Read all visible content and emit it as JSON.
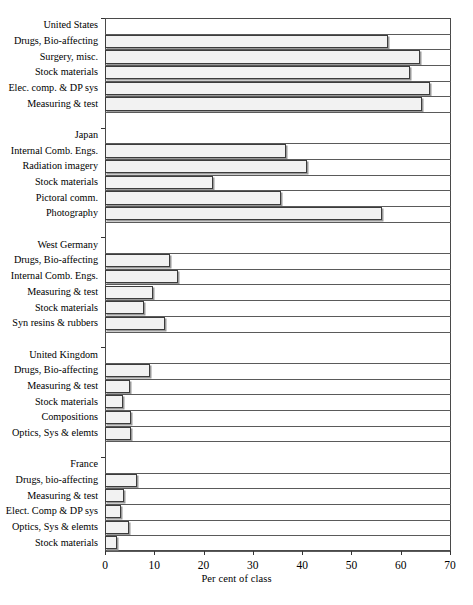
{
  "chart_data": {
    "type": "bar",
    "orientation": "horizontal",
    "title": "",
    "xlabel": "Per cent of class",
    "ylabel": "",
    "xlim": [
      0,
      70
    ],
    "xticks": [
      0,
      10,
      20,
      30,
      40,
      50,
      60,
      70
    ],
    "xticklabels": [
      "0",
      "10",
      "20",
      "30",
      "40",
      "50",
      "60",
      "70"
    ],
    "grid": false,
    "legend": null,
    "groups": [
      {
        "name": "United States",
        "categories": [
          "Drugs, Bio-affecting",
          "Surgery, misc.",
          "Stock materials",
          "Elec. comp. & DP sys",
          "Measuring & test"
        ],
        "values": [
          57.5,
          63.9,
          61.8,
          65.9,
          64.4
        ]
      },
      {
        "name": "Japan",
        "categories": [
          "Internal Comb. Engs.",
          "Radiation imagery",
          "Stock materials",
          "Pictoral comm.",
          "Photography"
        ],
        "values": [
          36.8,
          41.0,
          21.9,
          35.8,
          56.3
        ]
      },
      {
        "name": "West Germany",
        "categories": [
          "Drugs, Bio-affecting",
          "Internal Comb. Engs.",
          "Measuring & test",
          "Stock materials",
          "Syn resins & rubbers"
        ],
        "values": [
          13.2,
          14.9,
          9.8,
          8.0,
          12.2
        ]
      },
      {
        "name": "United Kingdom",
        "categories": [
          "Drugs, Bio-affecting",
          "Measuring & test",
          "Stock materials",
          "Compositions",
          "Optics, Sys & elemts"
        ],
        "values": [
          9.1,
          5.1,
          3.6,
          5.2,
          5.3
        ]
      },
      {
        "name": "France",
        "categories": [
          "Drugs, bio-affecting",
          "Measuring & test",
          "Elect. Comp & DP sys",
          "Optics, Sys & elemts",
          "Stock materials"
        ],
        "values": [
          6.5,
          3.8,
          3.3,
          4.8,
          2.5
        ]
      }
    ]
  }
}
